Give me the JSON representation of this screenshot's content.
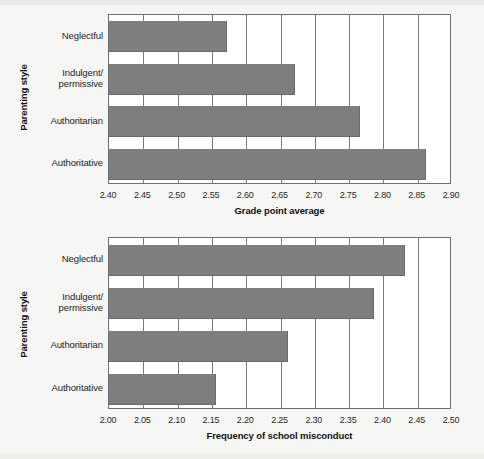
{
  "figure": {
    "background_color": "#f6f6f4",
    "bar_color": "#7e7e7e",
    "axis_color": "#6e6e6e"
  },
  "chart_data": [
    {
      "type": "bar",
      "orientation": "horizontal",
      "title": "",
      "xlabel": "Grade point average",
      "ylabel": "Parenting style",
      "categories": [
        "Neglectful",
        "Indulgent/\npermissive",
        "Authoritarian",
        "Authoritative"
      ],
      "category_labels": [
        [
          "Neglectful"
        ],
        [
          "Indulgent/",
          "permissive"
        ],
        [
          "Authoritarian"
        ],
        [
          "Authoritative"
        ]
      ],
      "values": [
        2.57,
        2.67,
        2.765,
        2.86
      ],
      "xlim": [
        2.4,
        2.9
      ],
      "xticks": [
        2.4,
        2.45,
        2.5,
        2.55,
        2.6,
        2.65,
        2.7,
        2.75,
        2.8,
        2.85,
        2.9
      ],
      "xtick_labels": [
        "2.40",
        "2.45",
        "2.50",
        "2.55",
        "2.60",
        "2.65",
        "2.70",
        "2.75",
        "2.80",
        "2.85",
        "2.90"
      ],
      "grid": "vertical",
      "legend": "none"
    },
    {
      "type": "bar",
      "orientation": "horizontal",
      "title": "",
      "xlabel": "Frequency of school misconduct",
      "ylabel": "Parenting style",
      "categories": [
        "Neglectful",
        "Indulgent/\npermissive",
        "Authoritarian",
        "Authoritative"
      ],
      "category_labels": [
        [
          "Neglectful"
        ],
        [
          "Indulgent/",
          "permissive"
        ],
        [
          "Authoritarian"
        ],
        [
          "Authoritative"
        ]
      ],
      "values": [
        2.43,
        2.385,
        2.26,
        2.155
      ],
      "xlim": [
        2.0,
        2.5
      ],
      "xticks": [
        2.0,
        2.05,
        2.1,
        2.15,
        2.2,
        2.25,
        2.3,
        2.35,
        2.4,
        2.45,
        2.5
      ],
      "xtick_labels": [
        "2.00",
        "2.05",
        "2.10",
        "2.15",
        "2.20",
        "2.25",
        "2.30",
        "2.35",
        "2.40",
        "2.45",
        "2.50"
      ],
      "grid": "vertical",
      "legend": "none"
    }
  ]
}
